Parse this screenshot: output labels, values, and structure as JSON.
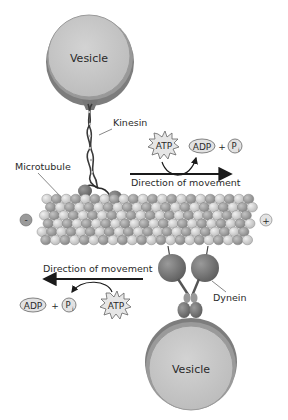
{
  "diagram": {
    "labels": {
      "top_vesicle": "Vesicle",
      "bottom_vesicle": "Vesicle",
      "kinesin": "Kinesin",
      "dynein": "Dynein",
      "microtubule": "Microtubule",
      "minus_end": "-",
      "plus_end": "+",
      "direction_top": "Direction of movement",
      "direction_bottom": "Direction of movement",
      "atp_top": "ATP",
      "atp_bottom": "ATP",
      "adp_top": "ADP",
      "adp_bottom": "ADP",
      "plus_top": "+",
      "plus_bottom": "+",
      "pi_top": "P",
      "pi_bottom": "P",
      "pi_sub": "i"
    },
    "colors": {
      "vesicle_fill": "#c9c9c9",
      "vesicle_rim": "#8a8a8a",
      "motor_head": "#7a7a7a",
      "tubulin_light": "#d8d8d8",
      "tubulin_dark": "#a6a6a6",
      "arrow": "#1a1a1a"
    }
  }
}
